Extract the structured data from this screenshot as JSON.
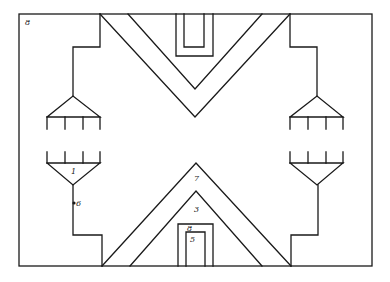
{
  "diagram": {
    "type": "floor-plan schematic",
    "labels": [
      {
        "id": "label-8-corner",
        "text": "8",
        "x": 25,
        "y": 25
      },
      {
        "id": "label-1",
        "text": "1",
        "x": 71,
        "y": 174
      },
      {
        "id": "label-6",
        "text": "6",
        "x": 72,
        "y": 206
      },
      {
        "id": "label-7",
        "text": "7",
        "x": 194,
        "y": 181
      },
      {
        "id": "label-3",
        "text": "3",
        "x": 194,
        "y": 212
      },
      {
        "id": "label-8-door",
        "text": "8",
        "x": 187,
        "y": 231
      },
      {
        "id": "label-5",
        "text": "5",
        "x": 190,
        "y": 242
      }
    ],
    "stroke_color": "#1a1a1a",
    "background": "#ffffff"
  }
}
